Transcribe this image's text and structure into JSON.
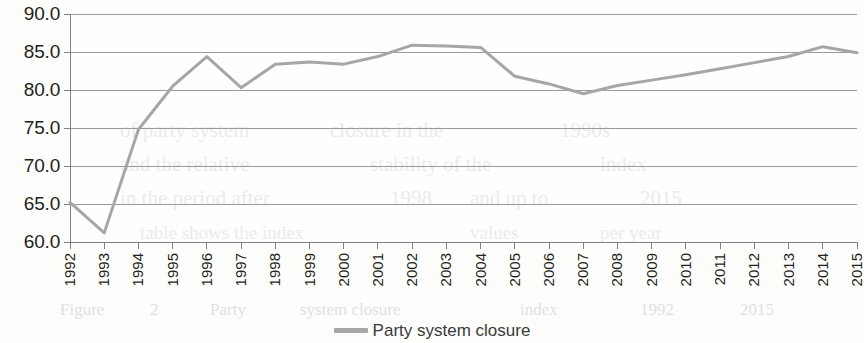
{
  "chart_data": {
    "type": "line",
    "title": "",
    "subtitle": "",
    "xlabel": "",
    "ylabel": "",
    "grid": true,
    "gridlines": "horizontal",
    "legend_position": "bottom-center",
    "xlim": [
      1992,
      2015
    ],
    "ylim": [
      60.0,
      90.0
    ],
    "ytick_step": 5.0,
    "ytick_labels": [
      "90.0",
      "85.0",
      "80.0",
      "75.0",
      "70.0",
      "65.0",
      "60.0"
    ],
    "ytick_values": [
      90.0,
      85.0,
      80.0,
      75.0,
      70.0,
      65.0,
      60.0
    ],
    "categories": [
      "1992",
      "1993",
      "1994",
      "1995",
      "1996",
      "1997",
      "1998",
      "1999",
      "2000",
      "2001",
      "2002",
      "2003",
      "2004",
      "2005",
      "2006",
      "2007",
      "2008",
      "2009",
      "2010",
      "2011",
      "2012",
      "2013",
      "2014",
      "2015"
    ],
    "x": [
      1992,
      1993,
      1994,
      1995,
      1996,
      1997,
      1998,
      1999,
      2000,
      2001,
      2002,
      2003,
      2004,
      2005,
      2006,
      2007,
      2008,
      2009,
      2010,
      2011,
      2012,
      2013,
      2014,
      2015
    ],
    "series": [
      {
        "name": "Party system closure",
        "color": "#a6a6a6",
        "line_width": 3,
        "markers": false,
        "values": [
          65.2,
          61.2,
          74.8,
          80.5,
          84.4,
          80.3,
          83.4,
          83.7,
          83.4,
          84.4,
          85.9,
          85.8,
          85.6,
          81.8,
          80.8,
          79.5,
          80.6,
          81.3,
          82.0,
          82.8,
          83.6,
          84.4,
          85.7,
          84.9
        ]
      }
    ],
    "annotations": []
  },
  "legend": {
    "entries": [
      {
        "label": "Party system closure",
        "swatch": "line-swatch-gray"
      }
    ]
  },
  "colors": {
    "series_line": "#a6a6a6",
    "gridline": "#9a9a9a",
    "axis": "#808080",
    "tick_text": "#231f20",
    "legend_text": "#3a3a3a",
    "background": "#fdfdfc"
  },
  "background_artifacts": [
    {
      "text": "of party system",
      "x": 120,
      "y": 118,
      "size": 21
    },
    {
      "text": "closure in the",
      "x": 330,
      "y": 118,
      "size": 21
    },
    {
      "text": "1990s",
      "x": 560,
      "y": 118,
      "size": 21
    },
    {
      "text": "and the relative",
      "x": 120,
      "y": 152,
      "size": 21
    },
    {
      "text": "stability of the",
      "x": 370,
      "y": 152,
      "size": 21
    },
    {
      "text": "index",
      "x": 600,
      "y": 152,
      "size": 21
    },
    {
      "text": "in the period after",
      "x": 120,
      "y": 186,
      "size": 21
    },
    {
      "text": "1998",
      "x": 390,
      "y": 186,
      "size": 21
    },
    {
      "text": "and up to",
      "x": 470,
      "y": 186,
      "size": 21
    },
    {
      "text": "2015",
      "x": 640,
      "y": 186,
      "size": 21
    },
    {
      "text": "table shows the index",
      "x": 140,
      "y": 222,
      "size": 19
    },
    {
      "text": "values",
      "x": 470,
      "y": 222,
      "size": 19
    },
    {
      "text": "per year",
      "x": 600,
      "y": 222,
      "size": 19
    },
    {
      "text": "Figure",
      "x": 60,
      "y": 300,
      "size": 17
    },
    {
      "text": "2",
      "x": 150,
      "y": 300,
      "size": 17
    },
    {
      "text": "Party",
      "x": 210,
      "y": 300,
      "size": 17
    },
    {
      "text": "system closure",
      "x": 300,
      "y": 300,
      "size": 17
    },
    {
      "text": "index",
      "x": 520,
      "y": 300,
      "size": 17
    },
    {
      "text": "1992",
      "x": 640,
      "y": 300,
      "size": 17
    },
    {
      "text": "2015",
      "x": 740,
      "y": 300,
      "size": 17
    }
  ]
}
